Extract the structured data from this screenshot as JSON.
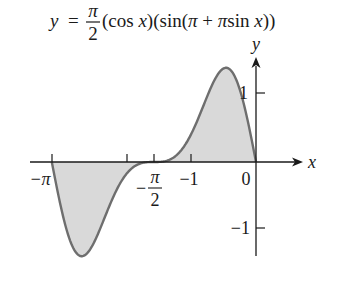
{
  "title": {
    "lhs": "y",
    "equals": "=",
    "frac_num": "π",
    "frac_den": "2",
    "rest_1": "(cos ",
    "rest_x1": "x",
    "rest_2": ")(sin(",
    "rest_pi1": "π",
    "rest_plus": " + ",
    "rest_pi2": "π",
    "rest_3": "sin ",
    "rest_x2": "x",
    "rest_4": "))"
  },
  "axes": {
    "x_label": "x",
    "y_label": "y",
    "x_ticks": [
      {
        "value": -3.14159,
        "label": "−π"
      },
      {
        "value": -1.98,
        "label": ""
      },
      {
        "value": -1.5708,
        "label_num": "π",
        "label_den": "2",
        "label_sign": "−"
      },
      {
        "value": -1,
        "label": "−1"
      },
      {
        "value": 0,
        "label": "0"
      }
    ],
    "y_ticks": [
      {
        "value": 1,
        "label": "1"
      },
      {
        "value": -1,
        "label": "−1"
      }
    ]
  },
  "colors": {
    "curve": "#6e6e6e",
    "fill": "#d9d9d9",
    "axis": "#1a1a1a"
  },
  "chart_data": {
    "type": "line",
    "xlabel": "x",
    "ylabel": "y",
    "function": "(pi/2)*cos(x)*sin(pi + pi*sin(x))",
    "domain": [
      -3.14159,
      0
    ],
    "xlim": [
      -3.3,
      0.75
    ],
    "ylim": [
      -1.45,
      1.6
    ],
    "grid": false,
    "shaded_region": "area between curve and x-axis on [-π, 0]",
    "x": [
      -3.1416,
      -2.9,
      -2.7,
      -2.6,
      -2.5,
      -2.3,
      -2.1,
      -1.9,
      -1.7,
      -1.5708,
      -1.4,
      -1.2,
      -1.0,
      -0.8,
      -0.6,
      -0.5,
      -0.4,
      -0.2,
      0
    ],
    "y": [
      0,
      -0.95,
      -1.37,
      -1.4,
      -1.31,
      -0.88,
      -0.41,
      -0.1,
      -0.01,
      0,
      0.01,
      0.11,
      0.41,
      0.88,
      1.32,
      1.4,
      1.37,
      0.95,
      0
    ],
    "extrema": [
      {
        "type": "min",
        "x": -2.6,
        "y": -1.4
      },
      {
        "type": "max",
        "x": -0.54,
        "y": 1.4
      }
    ]
  },
  "layout": {
    "origin_px": [
      256,
      162
    ],
    "x_unit_px": 65,
    "y_unit_px": 68
  }
}
